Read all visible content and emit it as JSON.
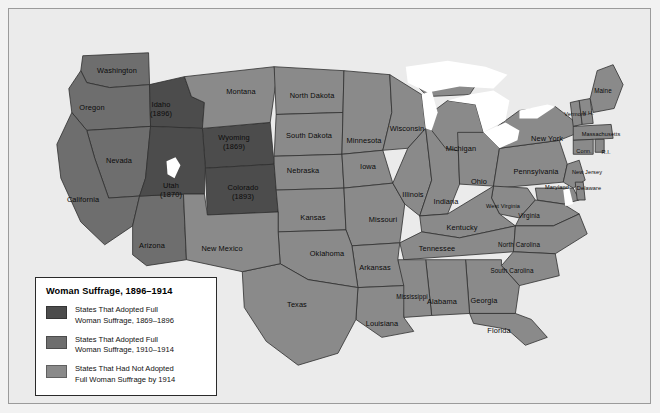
{
  "figure": {
    "kind": "thematic-choropleth-map",
    "region": "United States",
    "background_color": "#ebebeb",
    "frame_color": "#9b9b9b"
  },
  "legend": {
    "title": "Woman Suffrage, 1896–1914",
    "entries": [
      {
        "swatch_color": "#4c4c4c",
        "line1": "States That Adopted Full",
        "line2": "Woman Suffrage, 1869–1896"
      },
      {
        "swatch_color": "#6e6e6e",
        "line1": "States That Adopted Full",
        "line2": "Woman Suffrage, 1910–1914"
      },
      {
        "swatch_color": "#8a8a8a",
        "line1": "States That Had Not Adopted",
        "line2": "Full Woman Suffrage by 1914"
      }
    ]
  },
  "map": {
    "water_color": "#ffffff",
    "border_color": "#2f2f2f",
    "category_colors": {
      "adopted_1869_1896": "#4c4c4c",
      "adopted_1910_1914": "#6e6e6e",
      "not_adopted_by_1914": "#8a8a8a"
    },
    "states": [
      {
        "name": "Washington",
        "year": null,
        "category": "adopted_1910_1914",
        "x": 108,
        "y": 62,
        "size": ""
      },
      {
        "name": "Oregon",
        "year": null,
        "category": "adopted_1910_1914",
        "x": 83,
        "y": 99,
        "size": ""
      },
      {
        "name": "Idaho",
        "year": "(1896)",
        "category": "adopted_1869_1896",
        "x": 152,
        "y": 101,
        "size": ""
      },
      {
        "name": "Montana",
        "year": null,
        "category": "not_adopted_by_1914",
        "x": 232,
        "y": 83,
        "size": ""
      },
      {
        "name": "North Dakota",
        "year": null,
        "category": "not_adopted_by_1914",
        "x": 303,
        "y": 87,
        "size": ""
      },
      {
        "name": "South Dakota",
        "year": null,
        "category": "not_adopted_by_1914",
        "x": 300,
        "y": 127,
        "size": ""
      },
      {
        "name": "Minnesota",
        "year": null,
        "category": "not_adopted_by_1914",
        "x": 355,
        "y": 132,
        "size": ""
      },
      {
        "name": "Wisconsin",
        "year": null,
        "category": "not_adopted_by_1914",
        "x": 398,
        "y": 120,
        "size": ""
      },
      {
        "name": "Michigan",
        "year": null,
        "category": "not_adopted_by_1914",
        "x": 452,
        "y": 140,
        "size": ""
      },
      {
        "name": "Wyoming",
        "year": "(1869)",
        "category": "adopted_1869_1896",
        "x": 225,
        "y": 134,
        "size": ""
      },
      {
        "name": "Nevada",
        "year": null,
        "category": "adopted_1910_1914",
        "x": 110,
        "y": 152,
        "size": ""
      },
      {
        "name": "California",
        "year": null,
        "category": "adopted_1910_1914",
        "x": 74,
        "y": 191,
        "size": ""
      },
      {
        "name": "Utah",
        "year": "(1870)",
        "category": "adopted_1869_1896",
        "x": 162,
        "y": 182,
        "size": ""
      },
      {
        "name": "Colorado",
        "year": "(1893)",
        "category": "adopted_1869_1896",
        "x": 234,
        "y": 184,
        "size": ""
      },
      {
        "name": "Nebraska",
        "year": null,
        "category": "not_adopted_by_1914",
        "x": 294,
        "y": 162,
        "size": ""
      },
      {
        "name": "Iowa",
        "year": null,
        "category": "not_adopted_by_1914",
        "x": 359,
        "y": 158,
        "size": ""
      },
      {
        "name": "Illinois",
        "year": null,
        "category": "not_adopted_by_1914",
        "x": 404,
        "y": 186,
        "size": ""
      },
      {
        "name": "Indiana",
        "year": null,
        "category": "not_adopted_by_1914",
        "x": 437,
        "y": 193,
        "size": ""
      },
      {
        "name": "Ohio",
        "year": null,
        "category": "not_adopted_by_1914",
        "x": 470,
        "y": 173,
        "size": ""
      },
      {
        "name": "Pennsylvania",
        "year": null,
        "category": "not_adopted_by_1914",
        "x": 527,
        "y": 163,
        "size": ""
      },
      {
        "name": "New York",
        "year": null,
        "category": "not_adopted_by_1914",
        "x": 538,
        "y": 130,
        "size": ""
      },
      {
        "name": "Vermont",
        "year": null,
        "category": "not_adopted_by_1914",
        "x": 566,
        "y": 105,
        "size": "xs"
      },
      {
        "name": "N.H.",
        "year": null,
        "category": "not_adopted_by_1914",
        "x": 579,
        "y": 104,
        "size": "xs"
      },
      {
        "name": "Maine",
        "year": null,
        "category": "not_adopted_by_1914",
        "x": 594,
        "y": 82,
        "size": "sm"
      },
      {
        "name": "Massachusetts",
        "year": null,
        "category": "not_adopted_by_1914",
        "x": 592,
        "y": 125,
        "size": "xs"
      },
      {
        "name": "Conn.",
        "year": null,
        "category": "not_adopted_by_1914",
        "x": 575,
        "y": 142,
        "size": "xs"
      },
      {
        "name": "R.I.",
        "year": null,
        "category": "not_adopted_by_1914",
        "x": 597,
        "y": 143,
        "size": "xs"
      },
      {
        "name": "New Jersey",
        "year": null,
        "category": "not_adopted_by_1914",
        "x": 578,
        "y": 163,
        "size": "xs"
      },
      {
        "name": "Maryland",
        "year": null,
        "category": "not_adopted_by_1914",
        "x": 548,
        "y": 178,
        "size": "xs"
      },
      {
        "name": "Delaware",
        "year": null,
        "category": "not_adopted_by_1914",
        "x": 580,
        "y": 179,
        "size": "xs"
      },
      {
        "name": "West Virginia",
        "year": null,
        "category": "not_adopted_by_1914",
        "x": 494,
        "y": 197,
        "size": "xs"
      },
      {
        "name": "Virginia",
        "year": null,
        "category": "not_adopted_by_1914",
        "x": 520,
        "y": 207,
        "size": "sm"
      },
      {
        "name": "Kansas",
        "year": null,
        "category": "not_adopted_by_1914",
        "x": 304,
        "y": 209,
        "size": ""
      },
      {
        "name": "Missouri",
        "year": null,
        "category": "not_adopted_by_1914",
        "x": 374,
        "y": 211,
        "size": ""
      },
      {
        "name": "Kentucky",
        "year": null,
        "category": "not_adopted_by_1914",
        "x": 453,
        "y": 219,
        "size": ""
      },
      {
        "name": "Tennessee",
        "year": null,
        "category": "not_adopted_by_1914",
        "x": 428,
        "y": 240,
        "size": ""
      },
      {
        "name": "North Carolina",
        "year": null,
        "category": "not_adopted_by_1914",
        "x": 510,
        "y": 236,
        "size": "sm"
      },
      {
        "name": "South Carolina",
        "year": null,
        "category": "not_adopted_by_1914",
        "x": 503,
        "y": 262,
        "size": "sm"
      },
      {
        "name": "Arizona",
        "year": null,
        "category": "adopted_1910_1914",
        "x": 143,
        "y": 237,
        "size": ""
      },
      {
        "name": "New Mexico",
        "year": null,
        "category": "not_adopted_by_1914",
        "x": 213,
        "y": 240,
        "size": ""
      },
      {
        "name": "Oklahoma",
        "year": null,
        "category": "not_adopted_by_1914",
        "x": 318,
        "y": 245,
        "size": ""
      },
      {
        "name": "Arkansas",
        "year": null,
        "category": "not_adopted_by_1914",
        "x": 366,
        "y": 259,
        "size": ""
      },
      {
        "name": "Mississippi",
        "year": null,
        "category": "not_adopted_by_1914",
        "x": 403,
        "y": 288,
        "size": "sm"
      },
      {
        "name": "Alabama",
        "year": null,
        "category": "not_adopted_by_1914",
        "x": 433,
        "y": 293,
        "size": ""
      },
      {
        "name": "Georgia",
        "year": null,
        "category": "not_adopted_by_1914",
        "x": 475,
        "y": 292,
        "size": ""
      },
      {
        "name": "Florida",
        "year": null,
        "category": "not_adopted_by_1914",
        "x": 490,
        "y": 322,
        "size": ""
      },
      {
        "name": "Louisiana",
        "year": null,
        "category": "not_adopted_by_1914",
        "x": 373,
        "y": 315,
        "size": ""
      },
      {
        "name": "Texas",
        "year": null,
        "category": "not_adopted_by_1914",
        "x": 288,
        "y": 296,
        "size": ""
      }
    ]
  }
}
